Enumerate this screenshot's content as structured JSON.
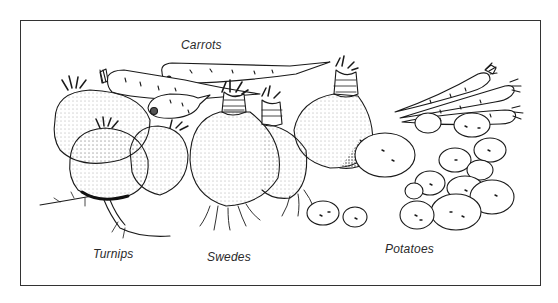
{
  "figure": {
    "labels": {
      "carrots": "Carrots",
      "turnips": "Turnips",
      "swedes": "Swedes",
      "potatoes": "Potatoes"
    },
    "colors": {
      "ink": "#1a1a1a",
      "paper": "#ffffff",
      "frame": "#333333"
    }
  }
}
